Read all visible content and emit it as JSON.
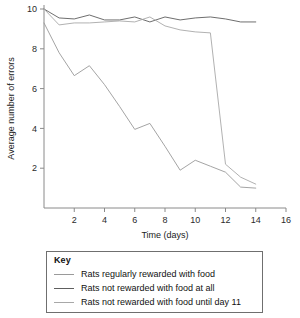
{
  "chart_data": {
    "type": "line",
    "title": "",
    "xlabel": "Time (days)",
    "ylabel": "Average number of errors",
    "xlim": [
      0,
      16
    ],
    "ylim": [
      0,
      10
    ],
    "xticks": [
      2,
      4,
      6,
      8,
      10,
      12,
      14,
      16
    ],
    "yticks": [
      2,
      4,
      6,
      8,
      10
    ],
    "grid": false,
    "legend_position": "below-plot",
    "series": [
      {
        "name": "Rats regularly rewarded with food",
        "color": "#9a9a9a",
        "x": [
          0,
          1,
          2,
          3,
          4,
          5,
          6,
          7,
          8,
          9,
          10,
          11,
          12,
          13,
          14
        ],
        "values": [
          9.3,
          7.8,
          6.65,
          7.15,
          6.2,
          5.1,
          3.95,
          4.25,
          3.1,
          1.9,
          2.4,
          2.1,
          1.8,
          1.05,
          1.0
        ]
      },
      {
        "name": "Rats not rewarded with food at all",
        "color": "#5e5e5e",
        "x": [
          0,
          1,
          2,
          3,
          4,
          5,
          6,
          7,
          8,
          9,
          10,
          11,
          12,
          13,
          14
        ],
        "values": [
          10.0,
          9.55,
          9.5,
          9.7,
          9.45,
          9.45,
          9.6,
          9.35,
          9.6,
          9.45,
          9.55,
          9.6,
          9.5,
          9.35,
          9.35
        ]
      },
      {
        "name": "Rats not rewarded with food until day 11",
        "color": "#a8a8a8",
        "x": [
          0,
          1,
          2,
          3,
          4,
          5,
          6,
          7,
          8,
          9,
          10,
          11,
          12,
          13,
          14
        ],
        "values": [
          10.0,
          9.2,
          9.3,
          9.3,
          9.35,
          9.4,
          9.35,
          9.6,
          9.15,
          8.95,
          8.85,
          8.8,
          2.2,
          1.55,
          1.2
        ]
      }
    ]
  },
  "axes": {
    "x_label": "Time (days)",
    "y_label": "Average number of errors",
    "x_tick_labels": [
      "2",
      "4",
      "6",
      "8",
      "10",
      "12",
      "14",
      "16"
    ],
    "y_tick_labels": [
      "2",
      "4",
      "6",
      "8",
      "10"
    ]
  },
  "legend": {
    "title": "Key",
    "items": [
      {
        "label": "Rats regularly rewarded with food",
        "color": "#9a9a9a"
      },
      {
        "label": "Rats not rewarded with food at all",
        "color": "#5e5e5e"
      },
      {
        "label": "Rats not rewarded with food until day 11",
        "color": "#a8a8a8"
      }
    ]
  }
}
